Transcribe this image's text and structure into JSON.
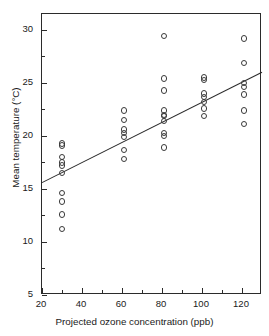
{
  "chart_data": {
    "type": "scatter",
    "title": "",
    "xlabel": "Projected ozone concentration (ppb)",
    "ylabel": "Mean temperature (°C)",
    "xlim": [
      20,
      130
    ],
    "ylim": [
      5,
      31.5
    ],
    "xticks": [
      20,
      40,
      60,
      80,
      100,
      120
    ],
    "xtick_labels": [
      "20",
      "40",
      "60",
      "80",
      "100",
      "120"
    ],
    "xminor_ticks": [
      30,
      50,
      70,
      90,
      110
    ],
    "yticks": [
      5,
      10,
      15,
      20,
      25,
      30
    ],
    "ytick_labels": [
      "5",
      "10",
      "15",
      "20",
      "25",
      "30"
    ],
    "yminor_ticks": [
      7.5,
      12.5,
      17.5,
      22.5,
      27.5
    ],
    "grid": false,
    "legend": "none",
    "marker": "open-circle",
    "marker_color": "#3a3a3a",
    "line_color": "#2b2b2b",
    "series": [
      {
        "name": "observations",
        "x": [
          30,
          30,
          30,
          30,
          30,
          30,
          30,
          30,
          30,
          30,
          61,
          61,
          61,
          61,
          61,
          61,
          61,
          81,
          81,
          81,
          81,
          81,
          81,
          81,
          81,
          81,
          81,
          101,
          101,
          101,
          101,
          101,
          101,
          101,
          121,
          121,
          121,
          121,
          121,
          121,
          121
        ],
        "y": [
          19.3,
          19.1,
          18.0,
          17.5,
          17.2,
          16.5,
          14.6,
          13.8,
          12.6,
          11.2,
          22.4,
          21.5,
          20.6,
          20.3,
          19.9,
          18.7,
          17.8,
          29.4,
          25.4,
          24.3,
          22.4,
          21.9,
          21.4,
          20.3,
          20.0,
          18.9,
          22.0,
          25.5,
          25.3,
          24.0,
          23.7,
          23.2,
          22.6,
          21.9,
          29.2,
          26.9,
          25.0,
          23.9,
          22.4,
          21.1,
          24.6
        ]
      }
    ],
    "trendline": {
      "name": "regression-line",
      "x": [
        20,
        130
      ],
      "y": [
        15.6,
        26.0
      ]
    }
  }
}
